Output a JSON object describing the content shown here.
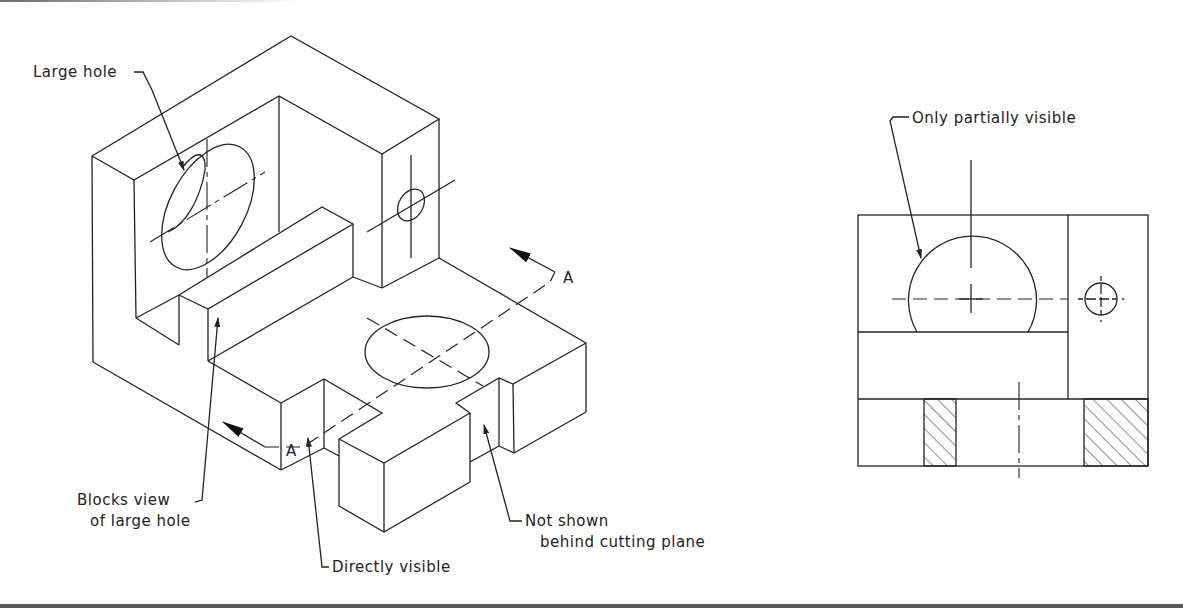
{
  "figure": {
    "type": "engineering drawing",
    "isometric_view": {
      "labels": {
        "large_hole": "Large hole",
        "blocks_view_line1": "Blocks view",
        "blocks_view_line2": "of large hole",
        "directly_visible": "Directly visible",
        "not_shown_line1": "Not shown",
        "not_shown_line2": "behind cutting plane",
        "section_letter_right": "A",
        "section_letter_left": "A"
      }
    },
    "orthographic_view": {
      "labels": {
        "only_partially_visible": "Only partially visible"
      }
    },
    "colors": {
      "line": "#222222",
      "background": "#ffffff",
      "frame_bar": "#5a5a5a"
    }
  }
}
